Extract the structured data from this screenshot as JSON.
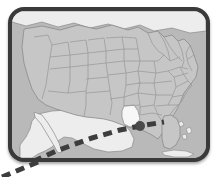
{
  "figure": {
    "kind": "map-graphic",
    "frame": {
      "shape": "rounded-rectangle",
      "bezel_color": "#3a3a3a",
      "corner_radius_px": 16
    },
    "colors": {
      "ocean": "#b9b9b9",
      "us_state_fill": "#c6c6c6",
      "state_border": "#9a9a9a",
      "country_border": "#8a8a8a",
      "neighbor_fill": "#ededed",
      "highlight_state_fill": "#f7f7f7",
      "lake_fill": "#d9d9d9",
      "track_line": "#3d3d3d",
      "landfall_marker": "#4a4a4a",
      "page_background": "#ffffff"
    },
    "regions": [
      {
        "name": "United States",
        "fill_role": "us_state_fill",
        "label": ""
      },
      {
        "name": "Canada",
        "fill_role": "neighbor_fill",
        "label": ""
      },
      {
        "name": "Mexico",
        "fill_role": "neighbor_fill",
        "label": ""
      },
      {
        "name": "Bahamas",
        "fill_role": "neighbor_fill",
        "label": ""
      },
      {
        "name": "Cuba",
        "fill_role": "neighbor_fill",
        "label": ""
      },
      {
        "name": "Great Lakes",
        "fill_role": "lake_fill",
        "label": ""
      }
    ],
    "highlighted_state": {
      "name": "Louisiana",
      "fill": "#f7f7f7",
      "label": ""
    },
    "storm_track": {
      "style": "dashed",
      "dash_pattern": "9 6",
      "stroke_width_px": 5,
      "color": "#3d3d3d",
      "direction": "southwest-to-northeast",
      "landfall_marker": {
        "shape": "circle",
        "radius_px": 5,
        "color": "#4a4a4a",
        "x": 136,
        "y": 126
      },
      "points": [
        {
          "x": 8,
          "y": 177
        },
        {
          "x": 52,
          "y": 155
        },
        {
          "x": 92,
          "y": 140
        },
        {
          "x": 120,
          "y": 131
        },
        {
          "x": 136,
          "y": 126
        },
        {
          "x": 160,
          "y": 122
        }
      ]
    },
    "legend": {
      "visible": false,
      "entries": []
    },
    "labels": []
  }
}
